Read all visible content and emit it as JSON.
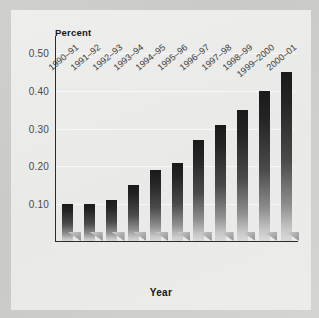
{
  "chart_data": {
    "type": "bar",
    "title": "",
    "xlabel": "Year",
    "ylabel": "Percent",
    "categories": [
      "1990–91",
      "1991–92",
      "1992–93",
      "1993–94",
      "1994–95",
      "1995–96",
      "1996–97",
      "1997–98",
      "1998–99",
      "1999–2000",
      "2000–01"
    ],
    "values": [
      0.1,
      0.1,
      0.11,
      0.15,
      0.19,
      0.21,
      0.27,
      0.31,
      0.35,
      0.4,
      0.45
    ],
    "ylim": [
      0.0,
      0.54
    ],
    "ytick_values": [
      0.1,
      0.2,
      0.3,
      0.4,
      0.5
    ],
    "ytick_labels": [
      "0.10",
      "0.20",
      "0.30",
      "0.40",
      "0.50"
    ],
    "grid": true,
    "legend": "none",
    "bar_color_top": "#1a1a1a",
    "bar_color_bottom": "#dcdcdc",
    "panel_color": "#ebebe9",
    "margin_color": "#cbcbc9",
    "axis_color": "#2b2b2b",
    "gridline_color": "#f7f7f5"
  }
}
